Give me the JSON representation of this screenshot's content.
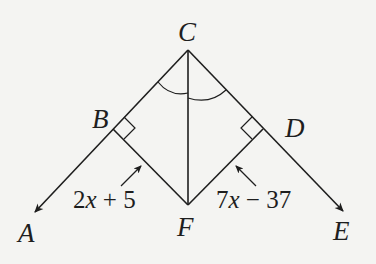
{
  "diagram": {
    "points": {
      "A": {
        "label": "A"
      },
      "B": {
        "label": "B"
      },
      "C": {
        "label": "C"
      },
      "D": {
        "label": "D"
      },
      "E": {
        "label": "E"
      },
      "F": {
        "label": "F"
      }
    },
    "segment_labels": {
      "BF": {
        "var": "x",
        "pre": "2",
        "post": " + 5"
      },
      "DF": {
        "var": "x",
        "pre": "7",
        "post": " − 37"
      }
    },
    "marks": {
      "right_angles": [
        "B",
        "D"
      ],
      "congruent_angles": [
        "BCF",
        "FCD"
      ],
      "rays": [
        "CA",
        "CE"
      ]
    },
    "colors": {
      "ink": "#1e1e1e",
      "background": "#f4f4f2"
    }
  }
}
